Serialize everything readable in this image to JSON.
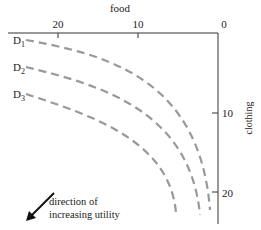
{
  "diagram": {
    "x_axis": {
      "label": "food",
      "ticks": [
        {
          "value": "20",
          "x": 58
        },
        {
          "value": "10",
          "x": 138
        },
        {
          "value": "0",
          "x": 222
        }
      ]
    },
    "y_axis": {
      "label": "clothing",
      "ticks": [
        {
          "value": "10",
          "y": 113
        },
        {
          "value": "20",
          "y": 193
        }
      ]
    },
    "curves": [
      {
        "label": "D",
        "subscript": "1"
      },
      {
        "label": "D",
        "subscript": "2"
      },
      {
        "label": "D",
        "subscript": "3"
      }
    ],
    "arrow_annotation": {
      "line1": "direction of",
      "line2": "increasing utility"
    },
    "colors": {
      "axis": "#333333",
      "curve": "#999999",
      "arrow": "#111111"
    }
  }
}
